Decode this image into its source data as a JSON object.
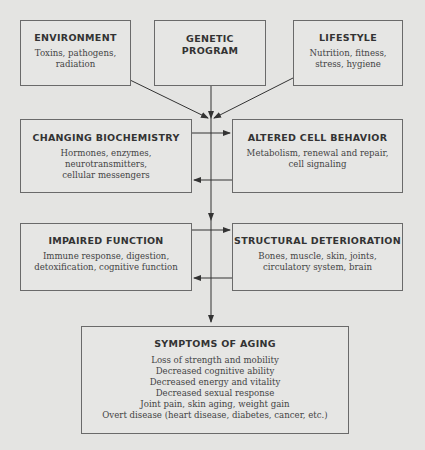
{
  "diagram": {
    "inputs": [
      {
        "title": "ENVIRONMENT",
        "desc": "Toxins, pathogens, radiation"
      },
      {
        "title": "GENETIC PROGRAM",
        "desc": ""
      },
      {
        "title": "LIFESTYLE",
        "desc": "Nutrition, fitness, stress, hygiene"
      }
    ],
    "row2": [
      {
        "title": "CHANGING BIOCHEMISTRY",
        "desc": "Hormones, enzymes, neurotransmitters, cellular messengers"
      },
      {
        "title": "ALTERED CELL BEHAVIOR",
        "desc": "Metabolism, renewal and repair, cell signaling"
      }
    ],
    "row3": [
      {
        "title": "IMPAIRED FUNCTION",
        "desc": "Immune response, digestion, detoxification,  cognitive function"
      },
      {
        "title": "STRUCTURAL DETERIORATION",
        "desc": "Bones, muscle, skin, joints, circulatory system, brain"
      }
    ],
    "symptoms": {
      "title": "SYMPTOMS OF AGING",
      "items": [
        "Loss of strength and mobility",
        "Decreased cognitive ability",
        "Decreased energy and vitality",
        "Decreased sexual response",
        "Joint pain, skin aging, weight gain",
        "Overt disease (heart disease, diabetes, cancer, etc.)"
      ]
    },
    "colors": {
      "background": "#e4e4e2",
      "border": "#6a6a6a",
      "text": "#3b3b3b",
      "arrow": "#333333"
    }
  }
}
